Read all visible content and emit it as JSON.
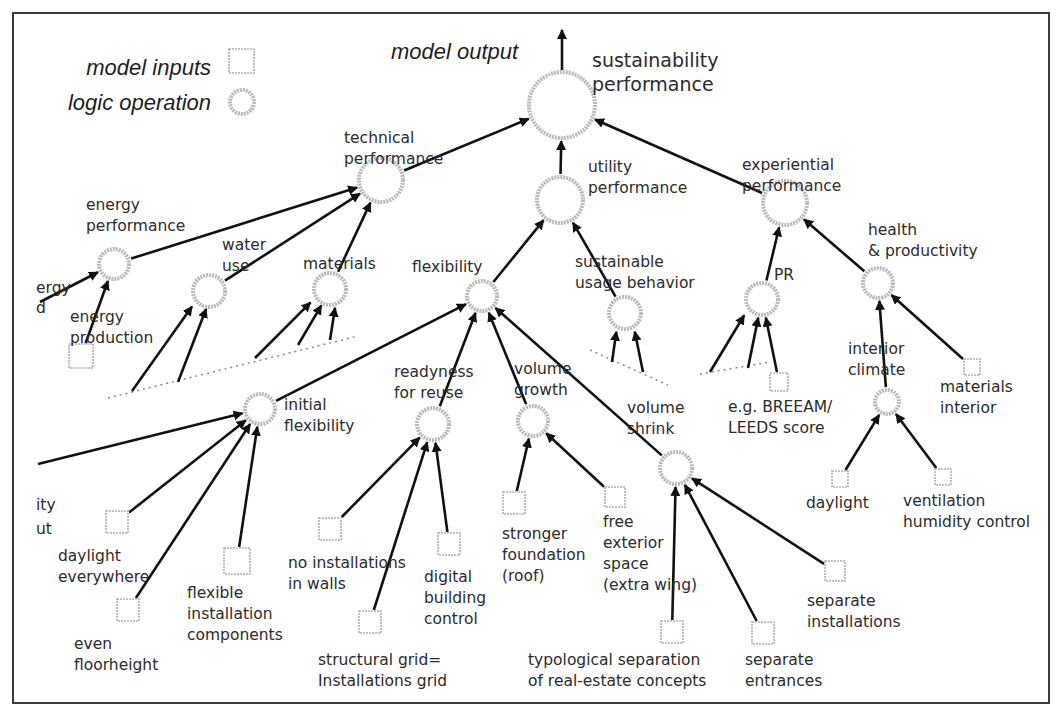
{
  "legend": {
    "inputs_label": "model inputs",
    "logic_label": "logic operation"
  },
  "output_label": "model output",
  "colors": {
    "node_stroke": "#b8b8b8",
    "edge": "#111111",
    "text": "#2b2b2b"
  },
  "nodes": [
    {
      "id": "sustain",
      "type": "circle",
      "x": 562,
      "y": 105,
      "r": 33,
      "label": [
        "sustainability",
        "performance"
      ],
      "lx": 592,
      "ly": 67,
      "big": true
    },
    {
      "id": "tech",
      "type": "circle",
      "x": 381,
      "y": 180,
      "r": 22,
      "label": [
        "technical",
        "performance"
      ],
      "lx": 344,
      "ly": 143
    },
    {
      "id": "util",
      "type": "circle",
      "x": 560,
      "y": 200,
      "r": 23,
      "label": [
        "utility",
        "performance"
      ],
      "lx": 588,
      "ly": 172
    },
    {
      "id": "exper",
      "type": "circle",
      "x": 785,
      "y": 203,
      "r": 22,
      "label": [
        "experiential",
        "performance"
      ],
      "lx": 742,
      "ly": 170
    },
    {
      "id": "energyperf",
      "type": "circle",
      "x": 114,
      "y": 264,
      "r": 15,
      "label": [
        "energy",
        "performance"
      ],
      "lx": 86,
      "ly": 210
    },
    {
      "id": "water",
      "type": "circle",
      "x": 209,
      "y": 291,
      "r": 16,
      "label": [
        "water",
        "use"
      ],
      "lx": 222,
      "ly": 250
    },
    {
      "id": "materials",
      "type": "circle",
      "x": 330,
      "y": 289,
      "r": 16,
      "label": [
        "materials"
      ],
      "lx": 303,
      "ly": 269
    },
    {
      "id": "flex",
      "type": "circle",
      "x": 482,
      "y": 296,
      "r": 15,
      "label": [
        "flexibility"
      ],
      "lx": 412,
      "ly": 272
    },
    {
      "id": "usage",
      "type": "circle",
      "x": 625,
      "y": 313,
      "r": 16,
      "label": [
        "sustainable",
        "usage behavior"
      ],
      "lx": 575,
      "ly": 267
    },
    {
      "id": "pr",
      "type": "circle",
      "x": 762,
      "y": 299,
      "r": 16,
      "label": [
        "PR"
      ],
      "lx": 774,
      "ly": 280
    },
    {
      "id": "health",
      "type": "circle",
      "x": 878,
      "y": 283,
      "r": 15,
      "label": [
        "health",
        "& productivity"
      ],
      "lx": 868,
      "ly": 235
    },
    {
      "id": "initflex",
      "type": "circle",
      "x": 260,
      "y": 409,
      "r": 15,
      "label": [
        "initial",
        "flexibility"
      ],
      "lx": 284,
      "ly": 410
    },
    {
      "id": "reuse",
      "type": "circle",
      "x": 433,
      "y": 424,
      "r": 16,
      "label": [
        "readyness",
        "for reuse"
      ],
      "lx": 394,
      "ly": 377
    },
    {
      "id": "growth",
      "type": "circle",
      "x": 533,
      "y": 421,
      "r": 15,
      "label": [
        "volume",
        "growth"
      ],
      "lx": 514,
      "ly": 374
    },
    {
      "id": "shrink",
      "type": "circle",
      "x": 676,
      "y": 468,
      "r": 16,
      "label": [
        "volume",
        "shrink"
      ],
      "lx": 627,
      "ly": 413
    },
    {
      "id": "climate",
      "type": "circle",
      "x": 887,
      "y": 402,
      "r": 12,
      "label": [
        "interior",
        "climate"
      ],
      "lx": 848,
      "ly": 354
    },
    {
      "id": "eprod",
      "type": "box",
      "x": 81,
      "y": 356,
      "s": 24,
      "label": [
        "energy",
        "production"
      ],
      "lx": 70,
      "ly": 322
    },
    {
      "id": "breeam",
      "type": "box",
      "x": 779,
      "y": 382,
      "s": 18,
      "label": [
        "e.g. BREEAM/",
        "LEEDS score"
      ],
      "lx": 728,
      "ly": 412
    },
    {
      "id": "matint",
      "type": "box",
      "x": 972,
      "y": 367,
      "s": 16,
      "label": [
        "materials",
        "interior"
      ],
      "lx": 940,
      "ly": 392
    },
    {
      "id": "daylight_e",
      "type": "box",
      "x": 117,
      "y": 522,
      "s": 22,
      "label": [
        "daylight",
        "everywhere"
      ],
      "lx": 58,
      "ly": 561
    },
    {
      "id": "floor",
      "type": "box",
      "x": 128,
      "y": 610,
      "s": 22,
      "label": [
        "even",
        "floorheight"
      ],
      "lx": 74,
      "ly": 649
    },
    {
      "id": "flexinst",
      "type": "box",
      "x": 237,
      "y": 561,
      "s": 26,
      "label": [
        "flexible",
        "installation",
        "components"
      ],
      "lx": 187,
      "ly": 598
    },
    {
      "id": "noinst",
      "type": "box",
      "x": 330,
      "y": 529,
      "s": 22,
      "label": [
        "no installations",
        "in walls"
      ],
      "lx": 288,
      "ly": 568
    },
    {
      "id": "grid",
      "type": "box",
      "x": 370,
      "y": 622,
      "s": 22,
      "label": [
        "structural grid=",
        "Installations grid"
      ],
      "lx": 318,
      "ly": 665
    },
    {
      "id": "digital",
      "type": "box",
      "x": 449,
      "y": 544,
      "s": 22,
      "label": [
        "digital",
        "building",
        "control"
      ],
      "lx": 424,
      "ly": 582
    },
    {
      "id": "foundation",
      "type": "box",
      "x": 514,
      "y": 503,
      "s": 22,
      "label": [
        "stronger",
        "foundation",
        "(roof)"
      ],
      "lx": 502,
      "ly": 539
    },
    {
      "id": "exterior",
      "type": "box",
      "x": 615,
      "y": 497,
      "s": 20,
      "label": [
        "free",
        "exterior",
        "space",
        "(extra wing)"
      ],
      "lx": 603,
      "ly": 527
    },
    {
      "id": "typo",
      "type": "box",
      "x": 672,
      "y": 632,
      "s": 22,
      "label": [
        "typological separation",
        "of real-estate concepts"
      ],
      "lx": 528,
      "ly": 665
    },
    {
      "id": "entrances",
      "type": "box",
      "x": 763,
      "y": 633,
      "s": 22,
      "label": [
        "separate",
        "entrances"
      ],
      "lx": 745,
      "ly": 665
    },
    {
      "id": "sepinst",
      "type": "box",
      "x": 835,
      "y": 571,
      "s": 20,
      "label": [
        "separate",
        "installations"
      ],
      "lx": 807,
      "ly": 606
    },
    {
      "id": "daylight",
      "type": "box",
      "x": 840,
      "y": 479,
      "s": 16,
      "label": [
        "daylight"
      ],
      "lx": 806,
      "ly": 508
    },
    {
      "id": "vent",
      "type": "box",
      "x": 943,
      "y": 477,
      "s": 16,
      "label": [
        "ventilation",
        "humidity control"
      ],
      "lx": 903,
      "ly": 506
    }
  ],
  "partial_labels": [
    {
      "text": "ergy",
      "x": 36,
      "y": 293
    },
    {
      "text": "d",
      "x": 36,
      "y": 313
    },
    {
      "text": "ity",
      "x": 36,
      "y": 510
    },
    {
      "text": "ut",
      "x": 36,
      "y": 534
    }
  ],
  "edges": [
    [
      "tech",
      "sustain"
    ],
    [
      "util",
      "sustain"
    ],
    [
      "exper",
      "sustain"
    ],
    [
      "energyperf",
      "tech"
    ],
    [
      "water",
      "tech"
    ],
    [
      "materials",
      "tech"
    ],
    [
      "flex",
      "util"
    ],
    [
      "usage",
      "util"
    ],
    [
      "pr",
      "exper"
    ],
    [
      "health",
      "exper"
    ],
    [
      "eprod",
      "energyperf"
    ],
    [
      "initflex",
      "flex"
    ],
    [
      "reuse",
      "flex"
    ],
    [
      "growth",
      "flex"
    ],
    [
      "shrink",
      "flex"
    ],
    [
      "daylight_e",
      "initflex"
    ],
    [
      "floor",
      "initflex"
    ],
    [
      "flexinst",
      "initflex"
    ],
    [
      "noinst",
      "reuse"
    ],
    [
      "grid",
      "reuse"
    ],
    [
      "digital",
      "reuse"
    ],
    [
      "foundation",
      "growth"
    ],
    [
      "exterior",
      "growth"
    ],
    [
      "typo",
      "shrink"
    ],
    [
      "entrances",
      "shrink"
    ],
    [
      "sepinst",
      "shrink"
    ],
    [
      "breeam",
      "pr"
    ],
    [
      "climate",
      "health"
    ],
    [
      "matint",
      "health"
    ],
    [
      "daylight",
      "climate"
    ],
    [
      "vent",
      "climate"
    ]
  ],
  "free_edges": [
    {
      "from": [
        40,
        302
      ],
      "to": "energyperf"
    },
    {
      "from": [
        132,
        391
      ],
      "to": "water",
      "dx": -6
    },
    {
      "from": [
        178,
        382
      ],
      "to": "water",
      "dx": 4
    },
    {
      "from": [
        255,
        358
      ],
      "to": "materials",
      "dx": -6
    },
    {
      "from": [
        298,
        345
      ],
      "to": "materials",
      "dx": 1
    },
    {
      "from": [
        330,
        340
      ],
      "to": "materials",
      "dx": 8
    },
    {
      "from": [
        38,
        464
      ],
      "to": "initflex"
    },
    {
      "from": [
        612,
        362
      ],
      "to": "usage",
      "dx": -6
    },
    {
      "from": [
        643,
        372
      ],
      "to": "usage",
      "dx": 6
    },
    {
      "from": [
        710,
        372
      ],
      "to": "pr",
      "dx": -8
    },
    {
      "from": [
        748,
        368
      ],
      "to": "pr",
      "dx": 0
    }
  ],
  "dotted_lines": [
    [
      [
        108,
        398
      ],
      [
        358,
        336
      ]
    ],
    [
      [
        590,
        350
      ],
      [
        668,
        385
      ]
    ],
    [
      [
        700,
        374
      ],
      [
        770,
        362
      ]
    ]
  ]
}
